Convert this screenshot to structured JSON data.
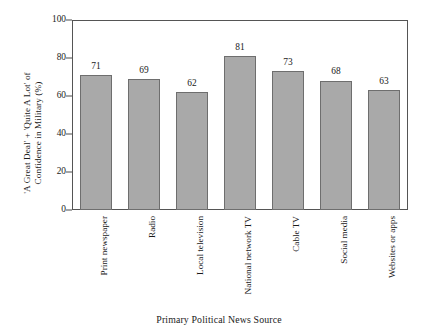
{
  "chart_data": {
    "type": "bar",
    "title": "",
    "categories": [
      "Print newspaper",
      "Radio",
      "Local television",
      "National network TV",
      "Cable TV",
      "Social media",
      "Websites or apps"
    ],
    "values": [
      71,
      69,
      62,
      81,
      73,
      68,
      63
    ],
    "value_labels": [
      "71",
      "69",
      "62",
      "81",
      "73",
      "68",
      "63"
    ],
    "xlabel": "Primary Political News Source",
    "ylabel_line1": "'A Great Deal' + 'Quite A Lot' of",
    "ylabel_line2": "Confidence in Military (%)",
    "ylim": [
      0,
      100
    ],
    "yticks": [
      0,
      20,
      40,
      60,
      80,
      100
    ],
    "ytick_labels": [
      "0",
      "20",
      "40",
      "60",
      "80",
      "100"
    ],
    "grid": false,
    "legend": false,
    "bar_color": "#a9a9a9",
    "bar_edge_color": "#6e6e6e",
    "axis_color": "#555555",
    "background_color": "#ffffff"
  }
}
